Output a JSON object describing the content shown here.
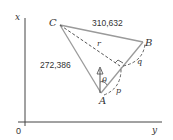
{
  "diagram": {
    "axes": {
      "x_label": "x",
      "y_label": "y",
      "origin_label": "0"
    },
    "points": {
      "A": "A",
      "B": "B",
      "C": "C"
    },
    "edges": {
      "CB_length": "310,632",
      "CA_length": "272,386"
    },
    "labels": {
      "r": "r",
      "p": "p",
      "q": "q",
      "theta": "θ"
    },
    "colors": {
      "axis": "#444444",
      "solid_edge": "#9a9a9a",
      "dashed": "#555555",
      "text": "#333333"
    }
  }
}
